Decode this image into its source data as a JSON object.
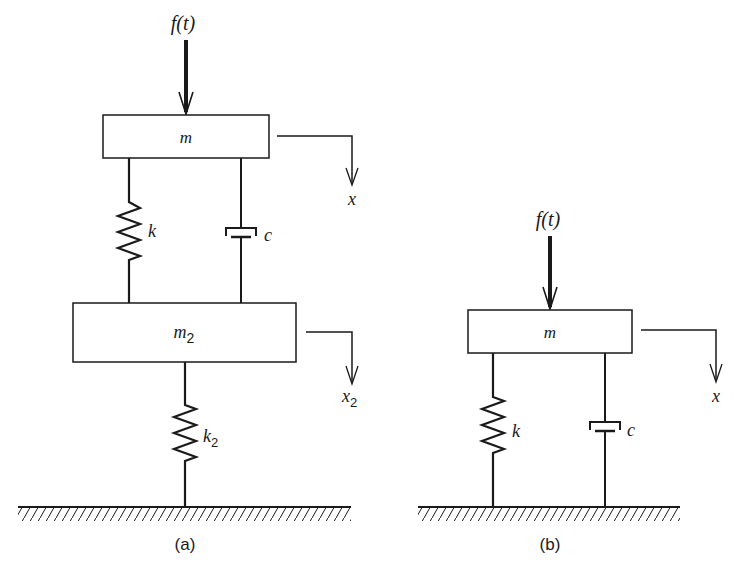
{
  "figure_a": {
    "caption": "(a)",
    "force_label": "f(t)",
    "mass_top_label": "m",
    "mass_bottom_label": "m",
    "mass_bottom_sub": "2",
    "spring_top_label": "k",
    "damper_label": "c",
    "spring_bottom_label": "k",
    "spring_bottom_sub": "2",
    "disp_top_label": "x",
    "disp_bottom_label": "x",
    "disp_bottom_sub": "2"
  },
  "figure_b": {
    "caption": "(b)",
    "force_label": "f(t)",
    "mass_label": "m",
    "spring_label": "k",
    "damper_label": "c",
    "disp_label": "x"
  },
  "colors": {
    "ink": "#1a1a1a",
    "background": "#ffffff"
  }
}
